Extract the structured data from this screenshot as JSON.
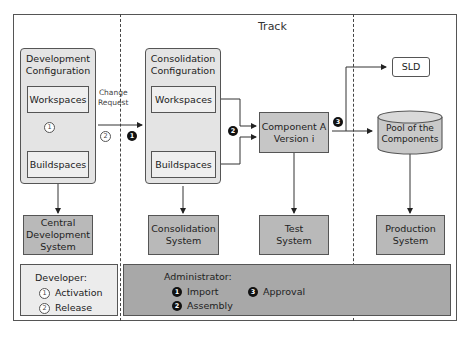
{
  "title": "Track",
  "dev_config": {
    "title_line1": "Development",
    "title_line2": "Configuration",
    "workspaces": "Workspaces",
    "buildspaces": "Buildspaces",
    "step": "1"
  },
  "cons_config": {
    "title_line1": "Consolidation",
    "title_line2": "Configuration",
    "workspaces": "Workspaces",
    "buildspaces": "Buildspaces"
  },
  "change_request": {
    "line1": "Change",
    "line2": "Request",
    "dev_step": "2",
    "admin_step": "1"
  },
  "assembly_step": "2",
  "approval_step": "3",
  "component": {
    "line1": "Component A",
    "line2": "Version i"
  },
  "sld": "SLD",
  "pool": {
    "line1": "Pool of the",
    "line2": "Components"
  },
  "systems": {
    "central": {
      "line1": "Central",
      "line2": "Development",
      "line3": "System"
    },
    "consolidation": {
      "line1": "Consolidation",
      "line2": "System"
    },
    "test": {
      "line1": "Test",
      "line2": "System"
    },
    "production": {
      "line1": "Production",
      "line2": "System"
    }
  },
  "legend_developer": {
    "title": "Developer:",
    "items": [
      {
        "num": "1",
        "label": "Activation"
      },
      {
        "num": "2",
        "label": "Release"
      }
    ]
  },
  "legend_admin": {
    "title": "Administrator:",
    "items": [
      {
        "num": "1",
        "label": "Import"
      },
      {
        "num": "2",
        "label": "Assembly"
      },
      {
        "num": "3",
        "label": "Approval"
      }
    ]
  }
}
